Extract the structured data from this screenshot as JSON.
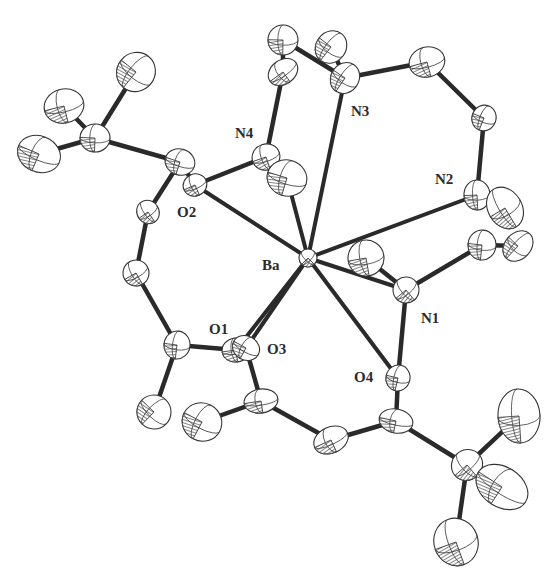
{
  "figure": {
    "type": "ORTEP crystal structure drawing",
    "central_atom": "Ba",
    "background_color": "#ffffff",
    "bond_color": "#2a2a2a"
  },
  "labels": {
    "ba": "Ba",
    "o1": "O1",
    "o2": "O2",
    "o3": "O3",
    "o4": "O4",
    "n1": "N1",
    "n2": "N2",
    "n3": "N3",
    "n4": "N4"
  },
  "atoms": [
    {
      "id": "Ba",
      "x": 308,
      "y": 258,
      "rx": 9,
      "ry": 9
    },
    {
      "id": "O1",
      "x": 236,
      "y": 350,
      "rx": 14,
      "ry": 12
    },
    {
      "id": "O3",
      "x": 246,
      "y": 348,
      "rx": 14,
      "ry": 12
    },
    {
      "id": "O2",
      "x": 195,
      "y": 185,
      "rx": 12,
      "ry": 11
    },
    {
      "id": "O4",
      "x": 398,
      "y": 378,
      "rx": 12,
      "ry": 13
    },
    {
      "id": "N1",
      "x": 406,
      "y": 290,
      "rx": 13,
      "ry": 13
    },
    {
      "id": "N2",
      "x": 477,
      "y": 195,
      "rx": 13,
      "ry": 15
    },
    {
      "id": "N3",
      "x": 345,
      "y": 78,
      "rx": 14,
      "ry": 16
    },
    {
      "id": "N4",
      "x": 266,
      "y": 157,
      "rx": 14,
      "ry": 13
    },
    {
      "id": "C1",
      "x": 180,
      "y": 162,
      "rx": 15,
      "ry": 13
    },
    {
      "id": "C2",
      "x": 148,
      "y": 212,
      "rx": 11,
      "ry": 12
    },
    {
      "id": "C3",
      "x": 95,
      "y": 138,
      "rx": 15,
      "ry": 14
    },
    {
      "id": "C4",
      "x": 136,
      "y": 72,
      "rx": 19,
      "ry": 20
    },
    {
      "id": "C5",
      "x": 64,
      "y": 106,
      "rx": 20,
      "ry": 17
    },
    {
      "id": "C6",
      "x": 39,
      "y": 154,
      "rx": 22,
      "ry": 18
    },
    {
      "id": "C7",
      "x": 136,
      "y": 273,
      "rx": 13,
      "ry": 13
    },
    {
      "id": "C8",
      "x": 177,
      "y": 345,
      "rx": 13,
      "ry": 14
    },
    {
      "id": "C9",
      "x": 154,
      "y": 412,
      "rx": 17,
      "ry": 17
    },
    {
      "id": "C10",
      "x": 261,
      "y": 401,
      "rx": 17,
      "ry": 12
    },
    {
      "id": "C11",
      "x": 202,
      "y": 422,
      "rx": 20,
      "ry": 19
    },
    {
      "id": "C12",
      "x": 331,
      "y": 440,
      "rx": 18,
      "ry": 13
    },
    {
      "id": "C13",
      "x": 396,
      "y": 421,
      "rx": 17,
      "ry": 12
    },
    {
      "id": "C14",
      "x": 467,
      "y": 465,
      "rx": 16,
      "ry": 15
    },
    {
      "id": "C15",
      "x": 519,
      "y": 416,
      "rx": 21,
      "ry": 27
    },
    {
      "id": "C16",
      "x": 502,
      "y": 487,
      "rx": 28,
      "ry": 20
    },
    {
      "id": "C17",
      "x": 456,
      "y": 542,
      "rx": 22,
      "ry": 24
    },
    {
      "id": "C18",
      "x": 287,
      "y": 178,
      "rx": 20,
      "ry": 18
    },
    {
      "id": "C19",
      "x": 283,
      "y": 72,
      "rx": 16,
      "ry": 12
    },
    {
      "id": "C20",
      "x": 283,
      "y": 40,
      "rx": 15,
      "ry": 15
    },
    {
      "id": "C21",
      "x": 331,
      "y": 47,
      "rx": 15,
      "ry": 17
    },
    {
      "id": "C22",
      "x": 427,
      "y": 62,
      "rx": 18,
      "ry": 15
    },
    {
      "id": "C23",
      "x": 484,
      "y": 118,
      "rx": 12,
      "ry": 13
    },
    {
      "id": "C24",
      "x": 505,
      "y": 208,
      "rx": 17,
      "ry": 22
    },
    {
      "id": "C25",
      "x": 482,
      "y": 245,
      "rx": 14,
      "ry": 15
    },
    {
      "id": "C26",
      "x": 518,
      "y": 246,
      "rx": 13,
      "ry": 17
    },
    {
      "id": "C27",
      "x": 366,
      "y": 258,
      "rx": 18,
      "ry": 18
    }
  ],
  "bonds": [
    [
      "C1",
      "O2"
    ],
    [
      "C1",
      "C2"
    ],
    [
      "C1",
      "C3"
    ],
    [
      "C3",
      "C4"
    ],
    [
      "C3",
      "C5"
    ],
    [
      "C3",
      "C6"
    ],
    [
      "C2",
      "C7"
    ],
    [
      "C7",
      "C8"
    ],
    [
      "C8",
      "O1"
    ],
    [
      "C8",
      "C9"
    ],
    [
      "O3",
      "C10"
    ],
    [
      "C10",
      "C11"
    ],
    [
      "C10",
      "C12"
    ],
    [
      "C12",
      "C13"
    ],
    [
      "C13",
      "O4"
    ],
    [
      "C13",
      "C14"
    ],
    [
      "C14",
      "C15"
    ],
    [
      "C14",
      "C16"
    ],
    [
      "C14",
      "C17"
    ],
    [
      "O2",
      "N4"
    ],
    [
      "N4",
      "C19"
    ],
    [
      "C19",
      "C20"
    ],
    [
      "C20",
      "N3"
    ],
    [
      "C21",
      "N3"
    ],
    [
      "N3",
      "C22"
    ],
    [
      "C22",
      "C23"
    ],
    [
      "C23",
      "N2"
    ],
    [
      "N2",
      "C24"
    ],
    [
      "N1",
      "C25"
    ],
    [
      "C25",
      "C26"
    ],
    [
      "N1",
      "C27"
    ],
    [
      "N1",
      "O4"
    ],
    [
      "N4",
      "C18"
    ]
  ],
  "coordination_bonds": [
    [
      "Ba",
      "O1"
    ],
    [
      "Ba",
      "O3"
    ],
    [
      "Ba",
      "O2"
    ],
    [
      "Ba",
      "O4"
    ],
    [
      "Ba",
      "N1"
    ],
    [
      "Ba",
      "N2"
    ],
    [
      "Ba",
      "N3"
    ],
    [
      "Ba",
      "C18"
    ]
  ]
}
